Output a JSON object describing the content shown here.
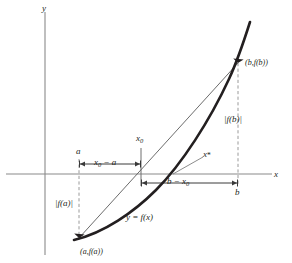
{
  "figure": {
    "kind": "math-diagram",
    "background_color": "#ffffff",
    "axes": {
      "x_label": "x",
      "y_label": "y",
      "axis_color": "#8a8a8a"
    },
    "curve": {
      "label": "y = f(x)",
      "color": "#231f20",
      "description": "increasing convex curve crossing the x-axis"
    },
    "secant": {
      "description": "thin chord joining (a,f(a)) to (b,f(b))",
      "color": "#5a5a5a"
    },
    "points": [
      {
        "id": "point-a",
        "label_text": "(a,f(a))",
        "marker": "filled-triangle"
      },
      {
        "id": "point-b",
        "label_text": "(b,f(b))",
        "marker": "filled-triangle"
      }
    ],
    "tick_labels": {
      "a": "a",
      "b": "b",
      "x0": "x",
      "x0_sub": "0",
      "xstar": "x",
      "xstar_sub": "*"
    },
    "dimension_labels": {
      "left_span": {
        "main": "x",
        "sub": "0",
        "tail": " − a"
      },
      "right_span": {
        "main": "b − x",
        "sub": "0"
      }
    },
    "value_labels": {
      "fa": "|f(a)|",
      "fb": "|f(b)|"
    },
    "colors": {
      "ink": "#231f20",
      "axis": "#8a8a8a",
      "dashed": "#9a9a9a",
      "thin_line": "#5a5a5a"
    }
  }
}
